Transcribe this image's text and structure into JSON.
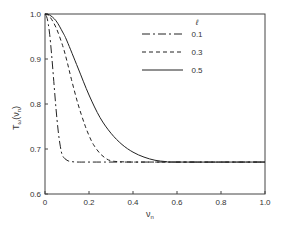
{
  "chart_data": {
    "type": "line",
    "title": "",
    "xlabel": "ν_n",
    "ylabel": "T_ω(ν_n)",
    "xlim": [
      0,
      1.0
    ],
    "ylim": [
      0.6,
      1.0
    ],
    "grid": false,
    "legend_position": "upper right (inside)",
    "legend_title": "ℓ",
    "x_ticks": [
      "0",
      "0.2",
      "0.4",
      "0.6",
      "0.8",
      "1.0"
    ],
    "y_ticks": [
      "0.6",
      "0.7",
      "0.8",
      "0.9",
      "1.0"
    ],
    "series": [
      {
        "name": "0.1",
        "style": "dash-dot",
        "x": [
          0,
          0.01,
          0.02,
          0.03,
          0.04,
          0.05,
          0.06,
          0.07,
          0.08,
          0.1,
          0.12,
          0.15,
          0.2,
          0.3,
          0.5,
          1.0
        ],
        "y": [
          1.0,
          0.99,
          0.96,
          0.91,
          0.85,
          0.79,
          0.74,
          0.705,
          0.685,
          0.675,
          0.672,
          0.671,
          0.671,
          0.671,
          0.671,
          0.671
        ]
      },
      {
        "name": "0.3",
        "style": "dashed",
        "x": [
          0,
          0.02,
          0.05,
          0.08,
          0.1,
          0.12,
          0.15,
          0.18,
          0.2,
          0.22,
          0.25,
          0.28,
          0.3,
          0.33,
          0.4,
          0.5,
          1.0
        ],
        "y": [
          1.0,
          0.995,
          0.97,
          0.93,
          0.895,
          0.855,
          0.8,
          0.755,
          0.73,
          0.71,
          0.69,
          0.678,
          0.674,
          0.672,
          0.671,
          0.671,
          0.671
        ]
      },
      {
        "name": "0.5",
        "style": "solid",
        "x": [
          0,
          0.02,
          0.05,
          0.08,
          0.1,
          0.15,
          0.2,
          0.25,
          0.3,
          0.35,
          0.4,
          0.45,
          0.5,
          0.55,
          0.6,
          1.0
        ],
        "y": [
          1.0,
          0.998,
          0.985,
          0.96,
          0.94,
          0.88,
          0.82,
          0.77,
          0.735,
          0.71,
          0.693,
          0.682,
          0.675,
          0.672,
          0.671,
          0.671
        ]
      }
    ]
  },
  "axes": {
    "y_label_main": "T",
    "y_label_sub": "ω",
    "y_label_paren": "(ν",
    "y_label_paren_sub": "n",
    "y_label_close": ")",
    "x_label_main": "ν",
    "x_label_sub": "n"
  },
  "legend": {
    "title": "ℓ",
    "entries": [
      "0.1",
      "0.3",
      "0.5"
    ]
  },
  "colors": {
    "line": "#222222",
    "axis": "#444444",
    "text": "#333333"
  }
}
